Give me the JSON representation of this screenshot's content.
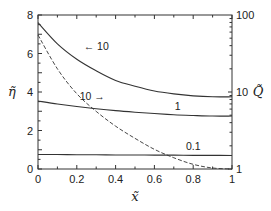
{
  "chart_data": {
    "type": "line",
    "title": "",
    "xlabel": "x̃",
    "ylabel": "η̃",
    "y2label": "Q̃",
    "xlim": [
      0,
      1
    ],
    "ylim": [
      0,
      8
    ],
    "y2lim": [
      1,
      100
    ],
    "y2scale": "log",
    "grid": false,
    "x_ticks": [
      0,
      0.2,
      0.4,
      0.6,
      0.8,
      1
    ],
    "x_tick_labels": [
      "0",
      "0.2",
      "0.4",
      "0.6",
      "0.8",
      "1"
    ],
    "y_ticks": [
      0,
      2,
      4,
      6,
      8
    ],
    "y_tick_labels": [
      "0",
      "2",
      "4",
      "6",
      "8"
    ],
    "y2_ticks": [
      1,
      10,
      100
    ],
    "y2_tick_labels": [
      "1",
      "10",
      "100"
    ],
    "x": [
      0,
      0.1,
      0.2,
      0.3,
      0.4,
      0.5,
      0.6,
      0.7,
      0.8,
      0.9,
      1.0
    ],
    "series": [
      {
        "name": "η̃ (10)",
        "axis": "left",
        "style": "solid",
        "label": "← 10",
        "values": [
          7.6,
          6.5,
          5.7,
          5.1,
          4.6,
          4.3,
          4.05,
          3.9,
          3.8,
          3.75,
          3.75
        ]
      },
      {
        "name": "η̃ (1)",
        "axis": "left",
        "style": "solid",
        "label": "1",
        "values": [
          3.53,
          3.38,
          3.25,
          3.13,
          3.03,
          2.95,
          2.88,
          2.82,
          2.78,
          2.75,
          2.75
        ]
      },
      {
        "name": "η̃ (0.1)",
        "axis": "left",
        "style": "solid",
        "label": "0.1",
        "values": [
          0.75,
          0.75,
          0.74,
          0.74,
          0.73,
          0.73,
          0.72,
          0.72,
          0.71,
          0.71,
          0.7
        ]
      },
      {
        "name": "Q̃ (10)",
        "axis": "right",
        "style": "dashed",
        "label": "10 →",
        "values": [
          55,
          20,
          9.5,
          5.6,
          3.6,
          2.5,
          1.8,
          1.4,
          1.15,
          1.03,
          1.0
        ]
      }
    ],
    "annotations": [
      {
        "text": "← 10",
        "x": 0.3,
        "y": 6.2
      },
      {
        "text": "10 →",
        "x": 0.28,
        "y": 3.6
      },
      {
        "text": "1",
        "x": 0.72,
        "y": 3.05
      },
      {
        "text": "0.1",
        "x": 0.8,
        "y": 1.0
      }
    ]
  }
}
